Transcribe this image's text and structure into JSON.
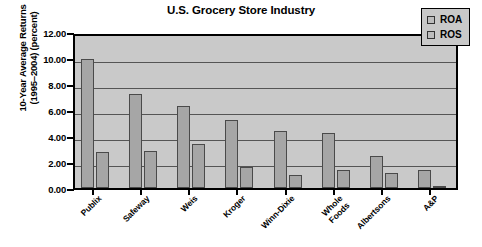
{
  "chart_data": {
    "type": "bar",
    "title": "U.S. Grocery Store Industry",
    "xlabel": "",
    "ylabel": "10-Year Average Returns\n(1995–2004) (percent)",
    "ylim": [
      0,
      12
    ],
    "ytick_labels": [
      "12.00",
      "10.00",
      "8.00",
      "6.00",
      "4.00",
      "2.00",
      "0.00"
    ],
    "ytick_values": [
      12,
      10,
      8,
      6,
      4,
      2,
      0
    ],
    "grid": true,
    "legend_position": "top-right",
    "categories": [
      "Publix",
      "Safeway",
      "Weis",
      "Kroger",
      "Winn-Dixie",
      "Whole\nFoods",
      "Albertsons",
      "A&P"
    ],
    "series": [
      {
        "name": "ROA",
        "values": [
          9.9,
          7.2,
          6.3,
          5.2,
          4.4,
          4.2,
          2.5,
          1.4
        ]
      },
      {
        "name": "ROS",
        "values": [
          2.8,
          2.85,
          3.4,
          1.65,
          1.0,
          1.4,
          1.15,
          0.15
        ]
      }
    ]
  },
  "legend": {
    "items": [
      {
        "label": "ROA"
      },
      {
        "label": "ROS"
      }
    ]
  }
}
